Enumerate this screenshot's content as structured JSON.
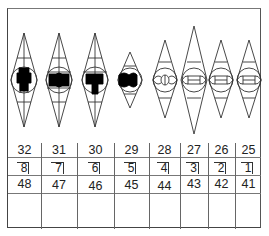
{
  "chart": {
    "title": "",
    "view": "lower-arch-occlusal",
    "teeth": [
      {
        "fdi": "32",
        "position": "8",
        "alt_fdi": "48",
        "filling": "large-mesio-occlusal",
        "filled": true
      },
      {
        "fdi": "31",
        "position": "7",
        "alt_fdi": "47",
        "filling": "large-occlusal",
        "filled": true
      },
      {
        "fdi": "30",
        "position": "6",
        "alt_fdi": "46",
        "filling": "large-occlusal-lingual",
        "filled": true
      },
      {
        "fdi": "29",
        "position": "5",
        "alt_fdi": "45",
        "filling": "occlusal",
        "filled": true
      },
      {
        "fdi": "28",
        "position": "4",
        "alt_fdi": "44",
        "filling": "none",
        "filled": false
      },
      {
        "fdi": "27",
        "position": "3",
        "alt_fdi": "43",
        "filling": "none",
        "filled": false
      },
      {
        "fdi": "26",
        "position": "2",
        "alt_fdi": "42",
        "filling": "none",
        "filled": false
      },
      {
        "fdi": "25",
        "position": "1",
        "alt_fdi": "41",
        "filling": "none",
        "filled": false
      }
    ]
  },
  "rows": {
    "universal": [
      "32",
      "31",
      "30",
      "29",
      "28",
      "27",
      "26",
      "25"
    ],
    "quadrant_position": [
      "8",
      "7",
      "6",
      "5",
      "4",
      "3",
      "2",
      "1"
    ],
    "fdi": [
      "48",
      "47",
      "46",
      "45",
      "44",
      "43",
      "42",
      "41"
    ],
    "notes": [
      "",
      "",
      "",
      "",
      "",
      "",
      "",
      ""
    ]
  },
  "colors": {
    "line": "#333333",
    "fill": "#000000",
    "background": "#ffffff"
  }
}
